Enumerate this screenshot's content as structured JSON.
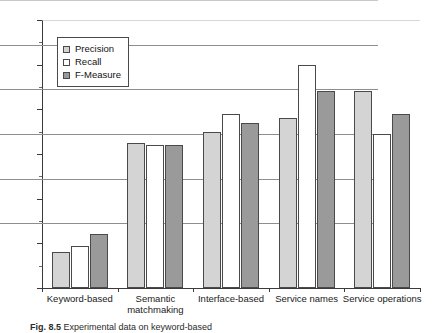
{
  "figure": {
    "caption_prefix": "Fig. 8.5",
    "caption_text": "Experimental data on keyword-based"
  },
  "legend": {
    "position": "inside-top-left",
    "items": [
      {
        "label": "Precision",
        "swatch": "light-gray",
        "color": "#d4d4d4"
      },
      {
        "label": "Recall",
        "swatch": "white",
        "color": "#ffffff"
      },
      {
        "label": "F-Measure",
        "swatch": "medium-gray",
        "color": "#9a9a9a"
      }
    ]
  },
  "axes": {
    "y_ticks": [
      0,
      20,
      40,
      60,
      80,
      100,
      120
    ],
    "y_tick_labels": [
      "0",
      "20",
      "40",
      "60",
      "80",
      "100",
      "120"
    ],
    "x_tick_labels": [
      "Keyword-based",
      "Semantic\nmatchmaking",
      "Interface-based",
      "Service names",
      "Service operations"
    ]
  },
  "chart_data": {
    "type": "bar",
    "title": "",
    "xlabel": "",
    "ylabel": "",
    "ylim": [
      0,
      120
    ],
    "ytick_step": 20,
    "grid": true,
    "legend_position": "upper left (inside plot)",
    "categories": [
      "Keyword-based",
      "Semantic matchmaking",
      "Interface-based",
      "Service names",
      "Service operations"
    ],
    "series": [
      {
        "name": "Precision",
        "color": "#d4d4d4",
        "values": [
          16,
          65,
          70,
          76,
          88
        ]
      },
      {
        "name": "Recall",
        "color": "#ffffff",
        "values": [
          19,
          64,
          78,
          100,
          69
        ]
      },
      {
        "name": "F-Measure",
        "color": "#9a9a9a",
        "values": [
          24,
          64,
          74,
          88,
          78
        ]
      }
    ]
  }
}
